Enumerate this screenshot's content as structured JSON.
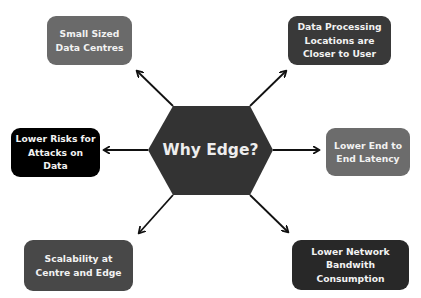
{
  "title": "Why Edge?",
  "hub": {
    "label": "Why Edge?",
    "shape": "hexagon",
    "color": "#333333"
  },
  "arrow_color": "#111111",
  "benefits": [
    {
      "id": "small-sized-data-centres",
      "label": "Small Sized\nData Centres",
      "color": "#6a6a6a",
      "position": "top-left"
    },
    {
      "id": "data-processing-closer",
      "label": "Data Processing\nLocations are\nCloser to User",
      "color": "#393939",
      "position": "top-right"
    },
    {
      "id": "lower-risks",
      "label": "Lower Risks for\nAttacks on Data",
      "color": "#000000",
      "position": "middle-left"
    },
    {
      "id": "lower-latency",
      "label": "Lower End to\nEnd Latency",
      "color": "#6c6c6c",
      "position": "middle-right"
    },
    {
      "id": "scalability",
      "label": "Scalability at\nCentre and Edge",
      "color": "#484848",
      "position": "bottom-left"
    },
    {
      "id": "lower-bandwidth",
      "label": "Lower Network\nBandwith Consumption",
      "color": "#282828",
      "position": "bottom-right"
    }
  ]
}
